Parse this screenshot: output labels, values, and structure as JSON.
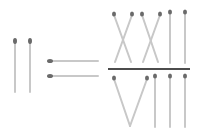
{
  "puzzle": {
    "type": "matchstick-equation",
    "left_side": "II",
    "operator": "=",
    "right_side": {
      "numerator": "XXII",
      "denominator": "VIII"
    },
    "expression": "II = XXII / VIII"
  },
  "colors": {
    "stick": "#c8c8c8",
    "head": "#6a6a6a",
    "fraction_bar": "#111111",
    "background": "#ffffff"
  }
}
